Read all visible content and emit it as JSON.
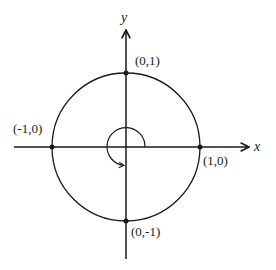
{
  "diagram": {
    "axes": {
      "x_label": "x",
      "y_label": "y"
    },
    "points": [
      {
        "id": "top",
        "label": "(0,1)",
        "x": 0,
        "y": 1
      },
      {
        "id": "left",
        "label": "(-1,0)",
        "x": -1,
        "y": 0
      },
      {
        "id": "right",
        "label": "(1,0)",
        "x": 1,
        "y": 0
      },
      {
        "id": "bottom",
        "label": "(0,-1)",
        "x": 0,
        "y": -1
      }
    ],
    "angle_arc": {
      "description": "counterclockwise arc from positive x-axis to negative y-axis (270 degrees)",
      "direction": "counterclockwise"
    },
    "colors": {
      "stroke": "#1a1a1a",
      "background": "#ffffff"
    }
  }
}
